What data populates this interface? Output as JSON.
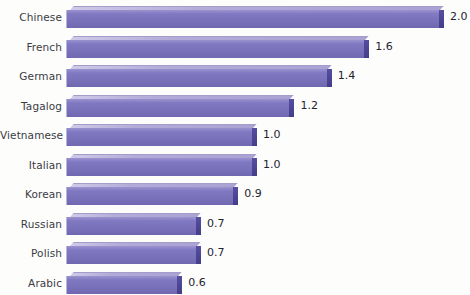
{
  "chart_data": {
    "type": "bar",
    "orientation": "horizontal",
    "title": "",
    "xlabel": "",
    "ylabel": "",
    "xlim": [
      0,
      2.0
    ],
    "grid": false,
    "legend": null,
    "categories": [
      "Chinese",
      "French",
      "German",
      "Tagalog",
      "Vietnamese",
      "Italian",
      "Korean",
      "Russian",
      "Polish",
      "Arabic"
    ],
    "values": [
      2.0,
      1.6,
      1.4,
      1.2,
      1.0,
      1.0,
      0.9,
      0.7,
      0.7,
      0.6
    ],
    "data_labels": [
      "2.0",
      "1.6",
      "1.4",
      "1.2",
      "1.0",
      "1.0",
      "0.9",
      "0.7",
      "0.7",
      "0.6"
    ],
    "bars": [
      {
        "label": "Chinese",
        "value": 2.0,
        "display": "2.0"
      },
      {
        "label": "French",
        "value": 1.6,
        "display": "1.6"
      },
      {
        "label": "German",
        "value": 1.4,
        "display": "1.4"
      },
      {
        "label": "Tagalog",
        "value": 1.2,
        "display": "1.2"
      },
      {
        "label": "Vietnamese",
        "value": 1.0,
        "display": "1.0"
      },
      {
        "label": "Italian",
        "value": 1.0,
        "display": "1.0"
      },
      {
        "label": "Korean",
        "value": 0.9,
        "display": "0.9"
      },
      {
        "label": "Russian",
        "value": 0.7,
        "display": "0.7"
      },
      {
        "label": "Polish",
        "value": 0.7,
        "display": "0.7"
      },
      {
        "label": "Arabic",
        "value": 0.6,
        "display": "0.6"
      }
    ],
    "bar_color": "#7971ba",
    "bar_top_color": "#b3acd9",
    "bar_side_color": "#4e4796",
    "background_color": "#fdfdfc",
    "label_color": "#3b3b44",
    "value_color": "#232330"
  },
  "title_remnant": ""
}
